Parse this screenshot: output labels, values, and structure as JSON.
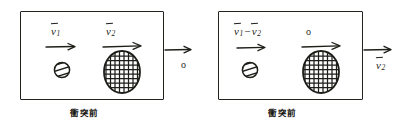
{
  "diagram": {
    "ink_color": "#1f1f1a",
    "background_color": "#ffffff",
    "panels": [
      {
        "id": "left",
        "caption": "衝突前",
        "inside_labels": {
          "small_ball_velocity": {
            "symbol": "v",
            "subscript": "1",
            "vector": true
          },
          "large_ball_velocity": {
            "symbol": "v",
            "subscript": "2",
            "vector": true
          }
        },
        "outside_labels": {
          "arrow_label": "o"
        },
        "objects": [
          {
            "name": "small-striped-ball",
            "shape": "circle",
            "fill": "diagonal-stripes"
          },
          {
            "name": "large-hatched-ellipse",
            "shape": "ellipse",
            "fill": "cross-hatch"
          }
        ],
        "arrows": [
          {
            "name": "small-ball-velocity-arrow",
            "direction": "right"
          },
          {
            "name": "large-ball-velocity-arrow",
            "direction": "right"
          },
          {
            "name": "external-frame-arrow",
            "direction": "right"
          }
        ]
      },
      {
        "id": "right",
        "caption": "衝突前",
        "inside_labels": {
          "relative_velocity": {
            "first": {
              "symbol": "v",
              "subscript": "1",
              "vector": true
            },
            "operator": "−",
            "second": {
              "symbol": "v",
              "subscript": "2",
              "vector": true
            }
          },
          "rest_marker": "o"
        },
        "outside_labels": {
          "arrow_label": {
            "symbol": "v",
            "subscript": "2",
            "vector": true
          }
        },
        "objects": [
          {
            "name": "small-striped-ball",
            "shape": "circle",
            "fill": "diagonal-stripes"
          },
          {
            "name": "large-hatched-ellipse",
            "shape": "ellipse",
            "fill": "cross-hatch"
          }
        ],
        "arrows": [
          {
            "name": "small-ball-velocity-arrow",
            "direction": "right"
          },
          {
            "name": "large-ball-velocity-arrow",
            "direction": "right"
          },
          {
            "name": "external-frame-arrow",
            "direction": "right"
          }
        ]
      }
    ]
  }
}
